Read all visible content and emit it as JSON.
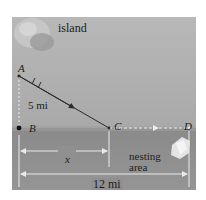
{
  "diagram": {
    "labels": {
      "island": "island",
      "nesting_area_line1": "nesting",
      "nesting_area_line2": "area"
    },
    "points": {
      "A": "A",
      "B": "B",
      "C": "C",
      "D": "D"
    },
    "distances": {
      "AB": "5 mi",
      "BC": "x",
      "BD": "12 mi"
    },
    "colors": {
      "sky": "#b4b4b4",
      "land": "#8e8e8e",
      "path": "#2a2a2a",
      "dimension_line": "#e8e8e8"
    }
  }
}
